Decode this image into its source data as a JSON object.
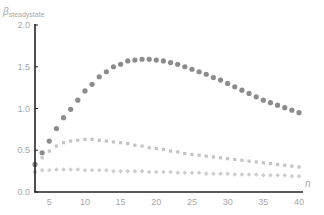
{
  "chart_data": {
    "type": "scatter",
    "title": "",
    "xlabel": "n",
    "ylabel": "β_steadystate",
    "ylabel_main": "β",
    "ylabel_sub": "steadystate",
    "xlim": [
      3,
      40
    ],
    "ylim": [
      0,
      2.0
    ],
    "x_ticks": [
      5,
      10,
      15,
      20,
      25,
      30,
      35,
      40
    ],
    "y_ticks": [
      "0.0",
      "0.5",
      "1.0",
      "1.5",
      "2.0"
    ],
    "grid": false,
    "legend": null,
    "x": [
      3,
      4,
      5,
      6,
      7,
      8,
      9,
      10,
      11,
      12,
      13,
      14,
      15,
      16,
      17,
      18,
      19,
      20,
      21,
      22,
      23,
      24,
      25,
      26,
      27,
      28,
      29,
      30,
      31,
      32,
      33,
      34,
      35,
      36,
      37,
      38,
      39,
      40
    ],
    "series": [
      {
        "name": "series-1",
        "color": "#8c8c8c",
        "marker": "circle",
        "values": [
          0.33,
          0.47,
          0.61,
          0.76,
          0.89,
          0.99,
          1.1,
          1.21,
          1.29,
          1.38,
          1.44,
          1.5,
          1.53,
          1.57,
          1.58,
          1.59,
          1.59,
          1.58,
          1.57,
          1.55,
          1.53,
          1.5,
          1.47,
          1.44,
          1.41,
          1.37,
          1.34,
          1.3,
          1.26,
          1.22,
          1.18,
          1.14,
          1.1,
          1.07,
          1.04,
          1.01,
          0.98,
          0.95
        ]
      },
      {
        "name": "series-2",
        "color": "#c4c4c4",
        "marker": "square",
        "values": [
          0.24,
          0.41,
          0.49,
          0.55,
          0.59,
          0.61,
          0.62,
          0.63,
          0.63,
          0.62,
          0.61,
          0.6,
          0.59,
          0.58,
          0.56,
          0.55,
          0.53,
          0.52,
          0.51,
          0.49,
          0.48,
          0.46,
          0.45,
          0.44,
          0.43,
          0.42,
          0.41,
          0.4,
          0.39,
          0.38,
          0.37,
          0.36,
          0.35,
          0.34,
          0.33,
          0.32,
          0.31,
          0.3
        ]
      },
      {
        "name": "series-3",
        "color": "#cdcdcd",
        "marker": "diamond",
        "values": [
          0.24,
          0.26,
          0.26,
          0.27,
          0.27,
          0.27,
          0.27,
          0.26,
          0.26,
          0.26,
          0.26,
          0.25,
          0.25,
          0.25,
          0.25,
          0.25,
          0.24,
          0.24,
          0.24,
          0.24,
          0.23,
          0.23,
          0.23,
          0.23,
          0.22,
          0.22,
          0.22,
          0.22,
          0.21,
          0.21,
          0.21,
          0.21,
          0.2,
          0.2,
          0.2,
          0.2,
          0.19,
          0.19
        ]
      }
    ]
  },
  "axes": {
    "x_label": "n",
    "y_label_main": "β",
    "y_label_sub": "steadystate"
  }
}
